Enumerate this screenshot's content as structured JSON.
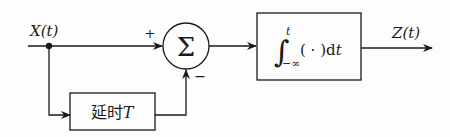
{
  "diagram": {
    "type": "block-diagram",
    "input": {
      "label": "X(t)"
    },
    "output": {
      "label": "Z(t)"
    },
    "summer": {
      "symbol": "Σ",
      "inputs": [
        {
          "sign": "+",
          "from": "X(t)"
        },
        {
          "sign": "−",
          "from": "延时T"
        }
      ]
    },
    "blocks": [
      {
        "id": "delay",
        "label_text": "延时",
        "label_var": "T"
      },
      {
        "id": "integrator",
        "upper_limit": "t",
        "lower_limit": "−∞",
        "body": "( · )d",
        "var": "t"
      }
    ],
    "colors": {
      "stroke": "#1a1a1a",
      "background": "#fdfdfd"
    }
  }
}
